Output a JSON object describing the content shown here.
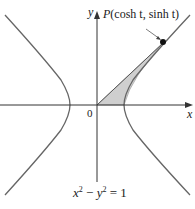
{
  "diagram": {
    "type": "unit-hyperbola-area",
    "axes": {
      "x_label": "x",
      "y_label": "y",
      "origin_label": "0"
    },
    "point": {
      "name": "P",
      "label": "P(cosh t, sinh t)",
      "coords_text": "(cosh t, sinh t)"
    },
    "equation": {
      "lhs_x": "x",
      "lhs_y": "y",
      "exp": "2",
      "minus": " − ",
      "rhs": " = 1"
    },
    "shaded_region": "area between ray OP, x-axis and right hyperbola branch",
    "colors": {
      "curve": "#555555",
      "axis": "#333333",
      "shade": "#c8c8c8",
      "point": "#111111"
    }
  }
}
